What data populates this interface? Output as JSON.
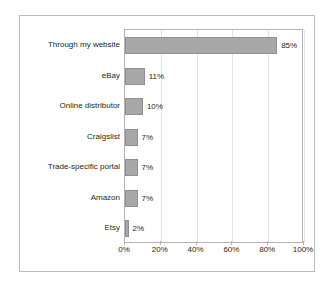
{
  "chart_data": {
    "type": "bar",
    "orientation": "horizontal",
    "title": "",
    "subtitle": "",
    "xlabel": "",
    "ylabel": "",
    "categories": [
      "Through my website",
      "eBay",
      "Online distributor",
      "Craigslist",
      "Trade-specific portal",
      "Amazon",
      "Etsy"
    ],
    "values": [
      85,
      11,
      10,
      7,
      7,
      7,
      2
    ],
    "value_labels": [
      "85%",
      "11%",
      "10%",
      "7%",
      "7%",
      "7%",
      "2%"
    ],
    "xlim": [
      0,
      100
    ],
    "xticks": [
      0,
      20,
      40,
      60,
      80,
      100
    ],
    "xtick_labels": [
      "0%",
      "20%",
      "40%",
      "60%",
      "80%",
      "100%"
    ],
    "grid": "vertical",
    "legend": "none",
    "bar_color": "#a8a8a8",
    "bar_border_color": "#8f8f8f",
    "gridline_color": "#e2e2e2",
    "axis_color": "#b4b4b4",
    "text_color": "#231f20",
    "background_color": "#ffffff",
    "border_color": "#bcbcbc"
  }
}
